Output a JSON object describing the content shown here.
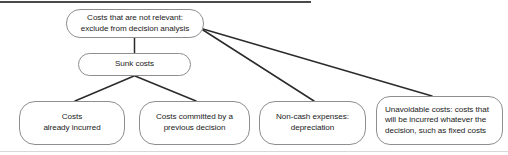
{
  "diagram": {
    "title": "Costs that are not relevant: exclude from decision analysis",
    "nodes": {
      "root": {
        "label": "Costs that are not relevant:\nexclude from decision analysis"
      },
      "sunk": {
        "label": "Sunk costs"
      },
      "already_incurred": {
        "label": "Costs\nalready incurred"
      },
      "committed": {
        "label": "Costs committed by a\nprevious decision"
      },
      "non_cash": {
        "label": "Non-cash expenses:\ndepreciation"
      },
      "unavoidable": {
        "label": "Unavoidable costs: costs that\nwill be incurred whatever the\ndecision, such as fixed costs"
      }
    },
    "colors": {
      "node_border": "#8e8e90",
      "node_fill": "#ffffff",
      "connector": "#2b2b2d",
      "text": "#1a1a1a",
      "rule_top": "#4a4a4c",
      "rule_bottom": "#d8d8dc",
      "background": "#ffffff"
    },
    "connectors": [
      {
        "name": "root-to-sunk",
        "from": "root",
        "to": "sunk"
      },
      {
        "name": "root-to-non-cash",
        "from": "root",
        "to": "non_cash"
      },
      {
        "name": "root-to-unavoidable",
        "from": "root",
        "to": "unavoidable"
      },
      {
        "name": "sunk-to-already-incurred",
        "from": "sunk",
        "to": "already_incurred"
      },
      {
        "name": "sunk-to-committed",
        "from": "sunk",
        "to": "committed"
      }
    ]
  }
}
